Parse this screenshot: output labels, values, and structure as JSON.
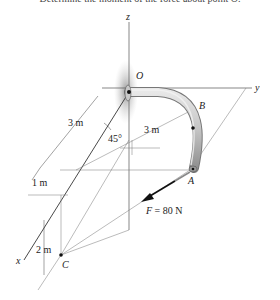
{
  "caption": "Determine the moment of the force about point O.",
  "axes": {
    "x": "x",
    "y": "y",
    "z": "z"
  },
  "points": {
    "O": "O",
    "A": "A",
    "B": "B",
    "C": "C"
  },
  "dimensions": {
    "d1": "3 m",
    "d2": "3 m",
    "d3": "1 m",
    "d4": "2 m",
    "angle": "45°"
  },
  "force": {
    "label": "F = 80 N",
    "symbol": "F",
    "value": "80 N"
  },
  "colors": {
    "line": "#555555",
    "pipe": "#b8b8b8",
    "shadow": "#9a9a9a",
    "arrow": "#111111"
  }
}
